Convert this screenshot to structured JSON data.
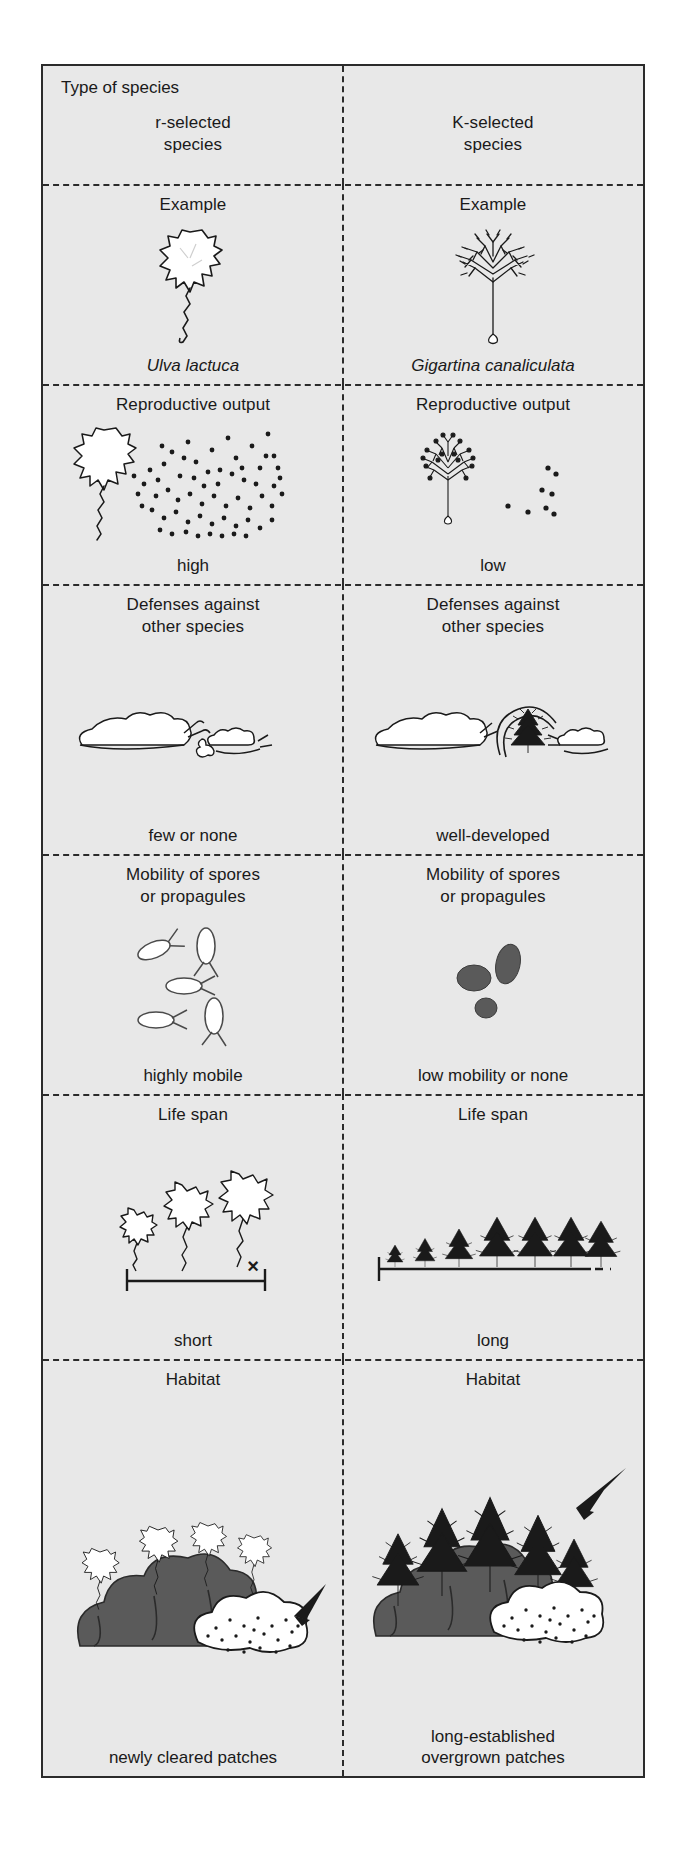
{
  "figure": {
    "corner_title": "Type of species",
    "columns": [
      {
        "key": "r",
        "title": "r-selected\nspecies"
      },
      {
        "key": "k",
        "title": "K-selected\nspecies"
      }
    ],
    "rows": [
      {
        "name": "example",
        "left": {
          "header": "Example",
          "caption": "Ulva lactuca",
          "caption_style": "italic",
          "icon": "sea-lettuce-algae-icon"
        },
        "right": {
          "header": "Example",
          "caption": "Gigartina canaliculata",
          "caption_style": "italic",
          "icon": "branching-red-algae-icon"
        }
      },
      {
        "name": "reproductive-output",
        "left": {
          "header": "Reproductive output",
          "caption": "high",
          "icon": "algae-with-many-spores-icon",
          "spore_count": 92
        },
        "right": {
          "header": "Reproductive output",
          "caption": "low",
          "icon": "algae-with-few-spores-icon",
          "spore_count": 8
        }
      },
      {
        "name": "defenses",
        "left": {
          "header": "Defenses against\nother species",
          "caption": "few or none",
          "icon": "grazing-snails-eating-algae-icon"
        },
        "right": {
          "header": "Defenses against\nother species",
          "caption": "well-developed",
          "icon": "protected-algae-with-barrier-icon"
        }
      },
      {
        "name": "mobility",
        "left": {
          "header": "Mobility of spores\nor propagules",
          "caption": "highly mobile",
          "icon": "flagellated-spores-icon",
          "propagule_count": 5
        },
        "right": {
          "header": "Mobility of spores\nor propagules",
          "caption": "low mobility or none",
          "icon": "non-motile-propagules-icon",
          "propagule_count": 3
        }
      },
      {
        "name": "life-span",
        "left": {
          "header": "Life span",
          "caption": "short",
          "icon": "growing-algae-timeline-icon",
          "marker": "×",
          "stage_count": 3
        },
        "right": {
          "header": "Life span",
          "caption": "long",
          "icon": "tree-row-timeline-icon",
          "stage_count": 7
        }
      },
      {
        "name": "habitat",
        "left": {
          "header": "Habitat",
          "caption": "newly cleared patches",
          "icon": "algae-patch-with-cleared-area-icon"
        },
        "right": {
          "header": "Habitat",
          "caption": "long-established\novergrown patches",
          "icon": "forested-overgrown-patch-icon"
        }
      }
    ]
  },
  "colors": {
    "panel_background": "#e8e8e8",
    "page_background": "#ffffff",
    "border": "#2b2b2b",
    "ink": "#1a1a1a",
    "dark_fill": "#5a5a5a",
    "light_fill": "#ffffff"
  }
}
